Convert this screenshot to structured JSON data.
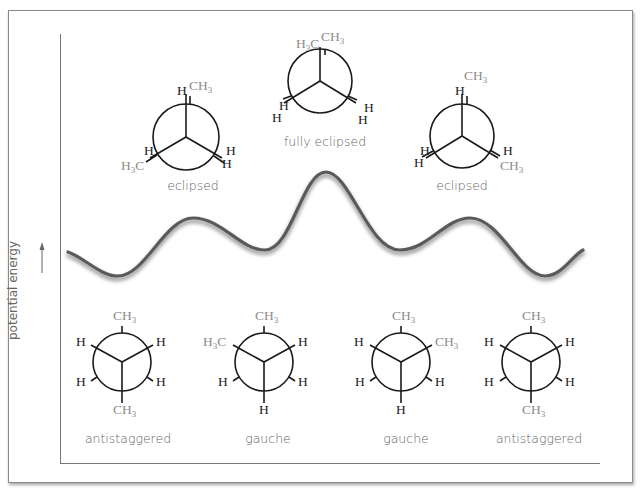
{
  "axis": {
    "y_label": "potential energy",
    "y_arrow": "arrow-up"
  },
  "colors": {
    "bond": "#1a1a1a",
    "h_atom": "#222222",
    "ch3_group": "#8c8c8c",
    "label": "#666666",
    "curve": "#555555",
    "frame": "#8a8a8a"
  },
  "eclipsed_conformations": [
    {
      "label": "eclipsed",
      "front": {
        "top": "H",
        "lower_left": "H",
        "lower_right": "H"
      },
      "back": {
        "top": "CH3",
        "lower_left": "H3C",
        "lower_right": "H"
      }
    },
    {
      "label": "fully eclipsed",
      "front": {
        "top": "H3C",
        "lower_left": "H",
        "lower_right": "H"
      },
      "back": {
        "top": "CH3",
        "lower_left": "H",
        "lower_right": "H"
      }
    },
    {
      "label": "eclipsed",
      "front": {
        "top": "H",
        "lower_left": "H",
        "lower_right": "H"
      },
      "back": {
        "top": "CH3",
        "lower_left": "H",
        "lower_right": "CH3"
      }
    }
  ],
  "staggered_conformations": [
    {
      "label": "antistaggered",
      "front": {
        "upper_left": "H",
        "upper_right": "H",
        "bottom": "CH3"
      },
      "back": {
        "top": "CH3",
        "lower_left": "H",
        "lower_right": "H"
      }
    },
    {
      "label": "gauche",
      "front": {
        "upper_left": "H3C",
        "upper_right": "H",
        "bottom": "H"
      },
      "back": {
        "top": "CH3",
        "lower_left": "H",
        "lower_right": "H"
      }
    },
    {
      "label": "gauche",
      "front": {
        "upper_left": "H",
        "upper_right": "CH3",
        "bottom": "H"
      },
      "back": {
        "top": "CH3",
        "lower_left": "H",
        "lower_right": "H"
      }
    },
    {
      "label": "antistaggered",
      "front": {
        "upper_left": "H",
        "upper_right": "H",
        "bottom": "CH3"
      },
      "back": {
        "top": "CH3",
        "lower_left": "H",
        "lower_right": "H"
      }
    }
  ],
  "energy_curve": {
    "description": "sinusoidal potential energy curve with maxima at eclipsed forms and minima at staggered forms",
    "points": [
      [
        68,
        252
      ],
      [
        118,
        276
      ],
      [
        193,
        218
      ],
      [
        265,
        250
      ],
      [
        326,
        172
      ],
      [
        400,
        250
      ],
      [
        470,
        218
      ],
      [
        545,
        276
      ],
      [
        583,
        250
      ]
    ]
  }
}
